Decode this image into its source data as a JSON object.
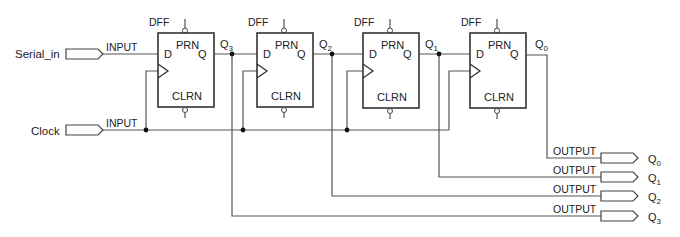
{
  "diagram": {
    "inputs": [
      {
        "name": "Serial_in",
        "type_label": "INPUT"
      },
      {
        "name": "Clock",
        "type_label": "INPUT"
      }
    ],
    "flip_flops": [
      {
        "type": "DFF",
        "preset": "PRN",
        "clear": "CLRN",
        "d": "D",
        "q": "Q",
        "output_name": "Q",
        "output_sub": "3"
      },
      {
        "type": "DFF",
        "preset": "PRN",
        "clear": "CLRN",
        "d": "D",
        "q": "Q",
        "output_name": "Q",
        "output_sub": "2"
      },
      {
        "type": "DFF",
        "preset": "PRN",
        "clear": "CLRN",
        "d": "D",
        "q": "Q",
        "output_name": "Q",
        "output_sub": "1"
      },
      {
        "type": "DFF",
        "preset": "PRN",
        "clear": "CLRN",
        "d": "D",
        "q": "Q",
        "output_name": "Q",
        "output_sub": "0"
      }
    ],
    "outputs": [
      {
        "type_label": "OUTPUT",
        "name": "Q",
        "sub": "0"
      },
      {
        "type_label": "OUTPUT",
        "name": "Q",
        "sub": "1"
      },
      {
        "type_label": "OUTPUT",
        "name": "Q",
        "sub": "2"
      },
      {
        "type_label": "OUTPUT",
        "name": "Q",
        "sub": "3"
      }
    ]
  }
}
